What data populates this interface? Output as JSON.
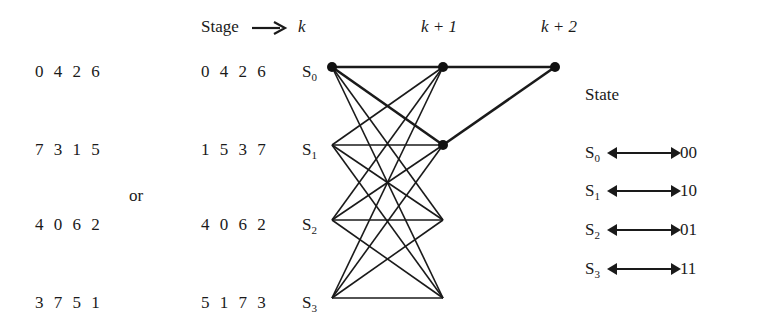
{
  "header": {
    "stage_label": "Stage",
    "arrow_icon": "right-arrow",
    "stages": [
      "k",
      "k + 1",
      "k + 2"
    ]
  },
  "left_sequences": [
    "0 4 2 6",
    "7 3 1 5",
    "4 0 6 2",
    "3 7 5 1"
  ],
  "or_label": "or",
  "right_sequences": [
    "0 4 2 6",
    "1 5 3 7",
    "4 0 6 2",
    "5 1 7 3"
  ],
  "states": [
    {
      "name": "S",
      "sub": "0"
    },
    {
      "name": "S",
      "sub": "1"
    },
    {
      "name": "S",
      "sub": "2"
    },
    {
      "name": "S",
      "sub": "3"
    }
  ],
  "legend": {
    "title": "State",
    "mappings": [
      {
        "state": "S",
        "sub": "0",
        "bits": "00"
      },
      {
        "state": "S",
        "sub": "1",
        "bits": "10"
      },
      {
        "state": "S",
        "sub": "2",
        "bits": "01"
      },
      {
        "state": "S",
        "sub": "3",
        "bits": "11"
      }
    ]
  },
  "trellis": {
    "columns_x": [
      332,
      443,
      555
    ],
    "rows_y": [
      67,
      145,
      220,
      298
    ],
    "full_connections_stage_k_to_k1": true,
    "highlighted_path_edges": [
      {
        "from": "S0@k",
        "to": "S0@k+1"
      },
      {
        "from": "S0@k",
        "to": "S1@k+1"
      },
      {
        "from": "S0@k+1",
        "to": "S0@k+2"
      },
      {
        "from": "S1@k+1",
        "to": "S0@k+2"
      }
    ],
    "nodes_filled": [
      "S0@k",
      "S0@k+1",
      "S1@k+1",
      "S0@k+2"
    ]
  }
}
